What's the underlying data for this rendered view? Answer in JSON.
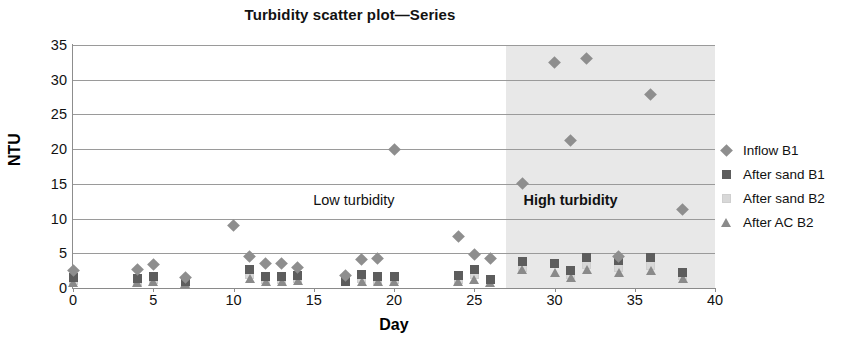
{
  "chart_data": {
    "type": "scatter",
    "title": "Turbidity scatter plot—Series",
    "xlabel": "Day",
    "ylabel": "NTU",
    "xlim": [
      0,
      40
    ],
    "ylim": [
      0,
      35
    ],
    "xticks": [
      0,
      5,
      10,
      15,
      20,
      25,
      30,
      35,
      40
    ],
    "yticks": [
      0,
      5,
      10,
      15,
      20,
      25,
      30,
      35
    ],
    "grid": "horizontal",
    "legend_position": "right",
    "annotations": [
      {
        "text": "Low turbidity",
        "x": 17.5,
        "y": 12.5,
        "bold": false
      },
      {
        "text": "High turbidity",
        "x": 31.0,
        "y": 12.5,
        "bold": true
      }
    ],
    "shaded_regions": [
      {
        "label": "High turbidity",
        "x_start": 27,
        "x_end": 40,
        "color": "#e8e8e8"
      }
    ],
    "series": [
      {
        "name": "Inflow B1",
        "marker": "diamond",
        "color": "#8e8e8e",
        "points": [
          [
            0,
            2.5
          ],
          [
            4,
            2.6
          ],
          [
            5,
            3.4
          ],
          [
            7,
            1.5
          ],
          [
            10,
            9.0
          ],
          [
            11,
            4.5
          ],
          [
            12,
            3.6
          ],
          [
            13,
            3.5
          ],
          [
            14,
            2.9
          ],
          [
            17,
            1.8
          ],
          [
            18,
            4.1
          ],
          [
            19,
            4.2
          ],
          [
            20,
            20.0
          ],
          [
            24,
            7.4
          ],
          [
            25,
            4.8
          ],
          [
            26,
            4.2
          ],
          [
            28,
            15.0
          ],
          [
            30,
            32.5
          ],
          [
            31,
            21.3
          ],
          [
            32,
            33.0
          ],
          [
            34,
            4.5
          ],
          [
            36,
            27.8
          ],
          [
            38,
            11.3
          ]
        ]
      },
      {
        "name": "After sand B1",
        "marker": "square",
        "color": "#5d5d5d",
        "points": [
          [
            0,
            1.5
          ],
          [
            4,
            1.4
          ],
          [
            5,
            1.6
          ],
          [
            7,
            1.0
          ],
          [
            11,
            2.6
          ],
          [
            12,
            1.7
          ],
          [
            13,
            1.6
          ],
          [
            14,
            1.8
          ],
          [
            17,
            1.0
          ],
          [
            18,
            1.9
          ],
          [
            19,
            1.6
          ],
          [
            20,
            1.7
          ],
          [
            24,
            1.8
          ],
          [
            25,
            2.6
          ],
          [
            26,
            1.2
          ],
          [
            28,
            3.8
          ],
          [
            30,
            3.6
          ],
          [
            31,
            2.5
          ],
          [
            32,
            4.4
          ],
          [
            34,
            3.9
          ],
          [
            36,
            4.4
          ],
          [
            38,
            2.2
          ]
        ]
      },
      {
        "name": "After sand B2",
        "marker": "square-light",
        "color": "#d8d8d8",
        "points": [
          [
            0,
            1.1
          ],
          [
            4,
            1.0
          ],
          [
            5,
            1.2
          ],
          [
            7,
            0.8
          ],
          [
            11,
            2.0
          ],
          [
            12,
            1.2
          ],
          [
            13,
            1.2
          ],
          [
            14,
            1.3
          ],
          [
            18,
            1.3
          ],
          [
            19,
            1.1
          ],
          [
            20,
            1.2
          ],
          [
            24,
            1.2
          ],
          [
            25,
            2.0
          ],
          [
            28,
            3.0
          ],
          [
            31,
            2.0
          ],
          [
            32,
            3.4
          ],
          [
            34,
            3.0
          ],
          [
            36,
            3.2
          ],
          [
            38,
            1.8
          ]
        ]
      },
      {
        "name": "After AC B2",
        "marker": "triangle",
        "color": "#8a8a8a",
        "points": [
          [
            0,
            0.8
          ],
          [
            4,
            0.8
          ],
          [
            5,
            0.9
          ],
          [
            7,
            0.7
          ],
          [
            11,
            1.3
          ],
          [
            12,
            0.9
          ],
          [
            13,
            1.0
          ],
          [
            14,
            1.1
          ],
          [
            18,
            1.0
          ],
          [
            19,
            0.9
          ],
          [
            20,
            0.9
          ],
          [
            24,
            0.9
          ],
          [
            25,
            1.2
          ],
          [
            26,
            0.8
          ],
          [
            28,
            2.6
          ],
          [
            30,
            2.3
          ],
          [
            31,
            1.5
          ],
          [
            32,
            2.6
          ],
          [
            34,
            2.3
          ],
          [
            36,
            2.5
          ],
          [
            38,
            1.4
          ]
        ]
      }
    ]
  },
  "legend": {
    "items": [
      {
        "label": "Inflow B1",
        "marker": "diamond"
      },
      {
        "label": "After sand B1",
        "marker": "square"
      },
      {
        "label": "After sand B2",
        "marker": "square-light"
      },
      {
        "label": "After AC B2",
        "marker": "triangle"
      }
    ]
  }
}
